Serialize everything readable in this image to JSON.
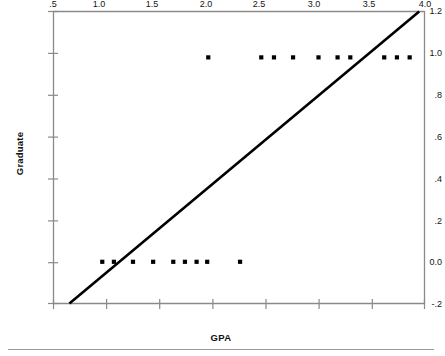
{
  "chart_data": {
    "type": "scatter",
    "title": "",
    "xlabel": "GPA",
    "ylabel": "Graduate",
    "xlim": [
      0.5,
      4.0
    ],
    "ylim": [
      -0.2,
      1.2
    ],
    "grid": false,
    "legend": null,
    "xticks": [
      ".5",
      "1.0",
      "1.5",
      "2.0",
      "2.5",
      "3.0",
      "3.5",
      "4.0"
    ],
    "xtick_values": [
      0.5,
      1.0,
      1.5,
      2.0,
      2.5,
      3.0,
      3.5,
      4.0
    ],
    "yticks": [
      "1.2",
      "1.0",
      ".8",
      ".6",
      ".4",
      ".2",
      "0.0",
      "-.2"
    ],
    "ytick_values": [
      1.2,
      1.0,
      0.8,
      0.6,
      0.4,
      0.2,
      0.0,
      -0.2
    ],
    "series": [
      {
        "name": "observations",
        "marker": "square",
        "color": "#000000",
        "points": [
          {
            "x": 1.96,
            "y": 0.98
          },
          {
            "x": 2.46,
            "y": 0.98
          },
          {
            "x": 2.58,
            "y": 0.98
          },
          {
            "x": 2.76,
            "y": 0.98
          },
          {
            "x": 3.0,
            "y": 0.98
          },
          {
            "x": 3.18,
            "y": 0.98
          },
          {
            "x": 3.3,
            "y": 0.98
          },
          {
            "x": 3.62,
            "y": 0.98
          },
          {
            "x": 3.74,
            "y": 0.98
          },
          {
            "x": 3.86,
            "y": 0.98
          },
          {
            "x": 0.96,
            "y": 0.0
          },
          {
            "x": 1.07,
            "y": 0.0
          },
          {
            "x": 1.25,
            "y": 0.0
          },
          {
            "x": 1.44,
            "y": 0.0
          },
          {
            "x": 1.63,
            "y": 0.0
          },
          {
            "x": 1.74,
            "y": 0.0
          },
          {
            "x": 1.85,
            "y": 0.0
          },
          {
            "x": 1.95,
            "y": 0.0
          },
          {
            "x": 2.26,
            "y": 0.0
          }
        ]
      }
    ],
    "fit_line": {
      "name": "linear-regression-line",
      "color": "#000000",
      "width": 2.6,
      "x_start": 0.65,
      "y_start": -0.2,
      "x_end": 3.95,
      "y_end": 1.2
    }
  },
  "axes": {
    "frame_color": "#8a8a8a",
    "marker_color": "#000000",
    "line_color": "#000000"
  }
}
